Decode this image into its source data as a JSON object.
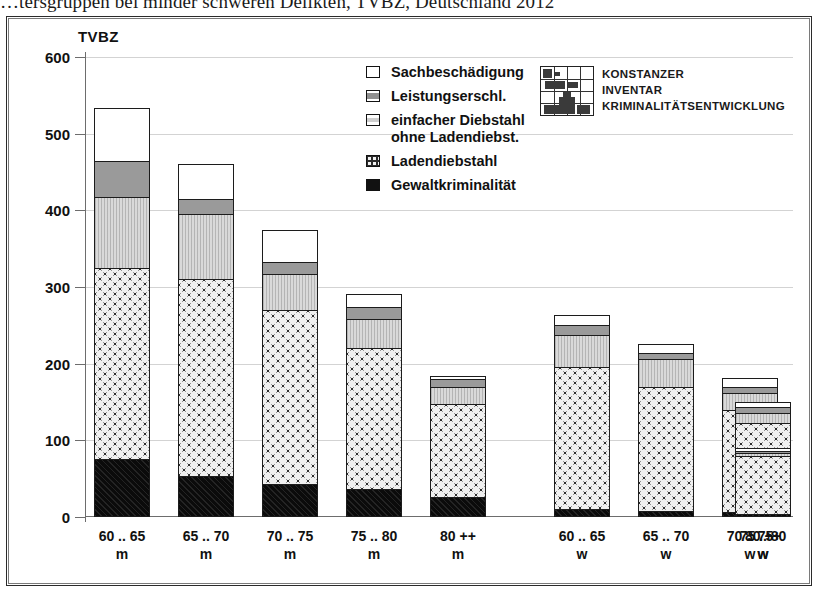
{
  "figure": {
    "title_clipped": "…tersgruppen bei minder schweren Delikten, TVBZ, Deutschland 2012",
    "axis_title": "TVBZ"
  },
  "legend": {
    "items": [
      {
        "label": "Sachbeschädigung",
        "key": "sach"
      },
      {
        "label": "Leistungserschl.",
        "key": "leist"
      },
      {
        "label": "einfacher Diebstahl",
        "label2": "ohne Ladendiebst.",
        "key": "einf"
      },
      {
        "label": "Ladendiebstahl",
        "key": "laden"
      },
      {
        "label": "Gewaltkriminalität",
        "key": "gewalt"
      }
    ]
  },
  "logo": {
    "line1": "KONSTANZER",
    "line2": "INVENTAR",
    "line3": "KRIMINALITÄTSENTWICKLUNG"
  },
  "yaxis": {
    "ticks": [
      "600",
      "500",
      "400",
      "300",
      "200",
      "100",
      "0"
    ]
  },
  "xaxis": {
    "labels": [
      {
        "l1": "60 .. 65",
        "l2": "m"
      },
      {
        "l1": "65 .. 70",
        "l2": "m"
      },
      {
        "l1": "70 .. 75",
        "l2": "m"
      },
      {
        "l1": "75 .. 80",
        "l2": "m"
      },
      {
        "l1": "80 ++",
        "l2": "m"
      },
      {
        "l1": "60 .. 65",
        "l2": "w"
      },
      {
        "l1": "65 .. 70",
        "l2": "w"
      },
      {
        "l1": "70 .. 75",
        "l2": "w"
      },
      {
        "l1": "75 .. 80",
        "l2": "w"
      },
      {
        "l1": "80 ++",
        "l2": "w"
      }
    ]
  },
  "chart_data": {
    "type": "bar",
    "stacked": true,
    "title": "…tersgruppen bei minder schweren Delikten, TVBZ, Deutschland 2012",
    "xlabel": "",
    "ylabel": "TVBZ",
    "ylim": [
      0,
      600
    ],
    "ytick_step": 100,
    "grid": true,
    "legend_position": "inside-top-center",
    "categories": [
      "60 .. 65 m",
      "65 .. 70 m",
      "70 .. 75 m",
      "75 .. 80 m",
      "80 ++ m",
      "60 .. 65 w",
      "65 .. 70 w",
      "70 .. 75 w",
      "75 .. 80 w",
      "80 ++ w"
    ],
    "series": [
      {
        "name": "Gewaltkriminalität",
        "values": [
          76,
          54,
          43,
          36,
          26,
          10,
          8,
          6,
          5,
          4
        ]
      },
      {
        "name": "Ladendiebstahl",
        "values": [
          249,
          256,
          227,
          185,
          121,
          186,
          162,
          134,
          117,
          76
        ]
      },
      {
        "name": "einfacher Diebstahl ohne Ladendiebst.",
        "values": [
          92,
          85,
          47,
          37,
          23,
          42,
          36,
          22,
          14,
          4
        ]
      },
      {
        "name": "Leistungserschl.",
        "values": [
          48,
          20,
          16,
          16,
          10,
          12,
          8,
          8,
          7,
          2
        ]
      },
      {
        "name": "Sachbeschädigung",
        "values": [
          68,
          46,
          41,
          17,
          4,
          13,
          12,
          11,
          7,
          3
        ]
      }
    ],
    "totals": [
      533,
      461,
      374,
      291,
      184,
      263,
      226,
      181,
      150,
      89
    ]
  }
}
